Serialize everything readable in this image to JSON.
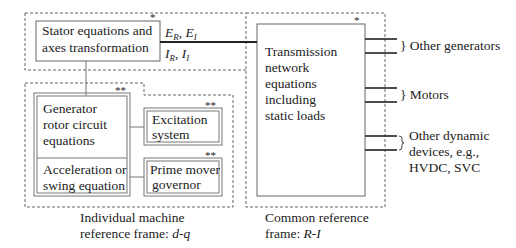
{
  "blocks": {
    "stator": {
      "lines": [
        "Stator equations and",
        "axes transformation"
      ],
      "marker": "*"
    },
    "transmission": {
      "lines": [
        "Transmission",
        "network",
        "equations",
        "including",
        "static loads"
      ],
      "marker": "*"
    },
    "generator": {
      "lines": [
        "Generator",
        "rotor circuit",
        "equations"
      ],
      "marker": "**"
    },
    "swing": {
      "lines": [
        "Acceleration or",
        "swing equation"
      ]
    },
    "excitation": {
      "lines": [
        "Excitation",
        "system"
      ],
      "marker": "**"
    },
    "governor": {
      "lines": [
        "Prime mover",
        "governor"
      ],
      "marker": "**"
    }
  },
  "signals": {
    "upper": {
      "a": "E",
      "a_sub": "R",
      "sep": ", ",
      "b": "E",
      "b_sub": "I"
    },
    "lower": {
      "a": "I",
      "a_sub": "R",
      "sep": ", ",
      "b": "I",
      "b_sub": "I"
    }
  },
  "connections": {
    "other_generators": "} Other generators",
    "motors": "} Motors",
    "other_devices": [
      "Other dynamic",
      "devices, e.g.,",
      "HVDC, SVC"
    ]
  },
  "frames": {
    "individual": {
      "line1": "Individual machine",
      "line2_prefix": "reference frame: ",
      "line2_italic": "d-q"
    },
    "common": {
      "line1": "Common reference",
      "line2_prefix": "frame: ",
      "line2_italic": "R-I"
    }
  }
}
